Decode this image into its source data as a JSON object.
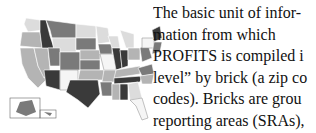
{
  "figure": {
    "colors": {
      "dark": "#3a3a3a",
      "mid": "#7a7a7a",
      "light": "#b4b4b4",
      "pale": "#dcdcdc",
      "white": "#f5f5f5"
    }
  },
  "text": {
    "lines": [
      "The basic unit of infor-",
      "mation from which",
      "PROFITS is compiled i",
      "level” by brick (a zip co",
      "codes).  Bricks are grou",
      "reporting areas (SRAs),"
    ]
  }
}
